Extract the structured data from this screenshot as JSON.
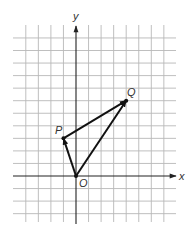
{
  "diagram": {
    "type": "coordinate-vector-diagram",
    "axes": {
      "x_label": "x",
      "y_label": "y",
      "x_range": [
        -5,
        7
      ],
      "y_range": [
        -3,
        11
      ]
    },
    "grid": {
      "x_lines": [
        -4,
        -3,
        -2,
        -1,
        1,
        2,
        3,
        4,
        5,
        6,
        7
      ],
      "y_lines": [
        -3,
        -2,
        -1,
        1,
        2,
        3,
        4,
        5,
        6,
        7,
        8,
        9,
        10,
        11
      ]
    },
    "points": [
      {
        "name": "O",
        "label": "O",
        "x": 0,
        "y": 0
      },
      {
        "name": "P",
        "label": "P",
        "x": -1,
        "y": 3
      },
      {
        "name": "Q",
        "label": "Q",
        "x": 4,
        "y": 6
      }
    ],
    "vectors": [
      {
        "name": "OP",
        "from": "O",
        "to": "P"
      },
      {
        "name": "OQ",
        "from": "O",
        "to": "Q"
      },
      {
        "name": "PQ",
        "from": "P",
        "to": "Q"
      }
    ],
    "colors": {
      "grid": "#b8b8b8",
      "axis": "#222222",
      "vector": "#111111",
      "label": "#333333"
    }
  }
}
